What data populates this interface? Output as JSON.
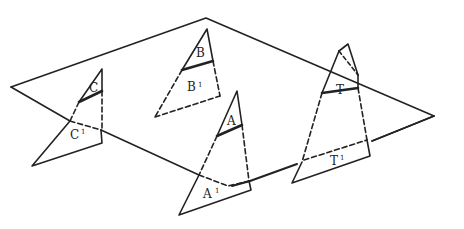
{
  "diagram": {
    "title": "",
    "colors": {
      "line": "#222222",
      "background": "#ffffff"
    },
    "plane": {
      "vertices": [
        [
          206,
          18
        ],
        [
          434,
          116
        ],
        [
          233,
          186
        ],
        [
          11,
          87
        ]
      ]
    },
    "labels": {
      "A": "A",
      "A1": "A",
      "A1_sup": "1",
      "B": "B",
      "B1": "B",
      "B1_sup": "1",
      "C": "C",
      "C1": "C",
      "C1_sup": "1",
      "T": "T",
      "T1": "T",
      "T1_sup": "1"
    }
  }
}
